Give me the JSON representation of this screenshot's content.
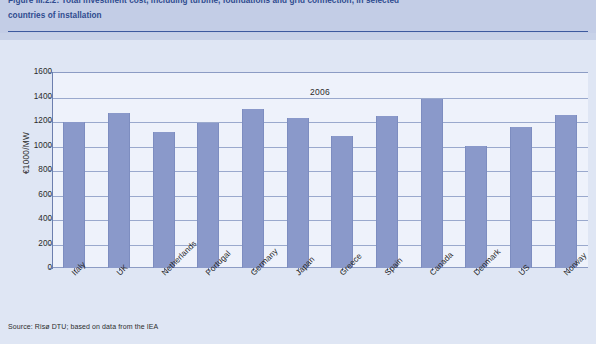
{
  "figure": {
    "caption_line1": "Figure III.2.2: Total investment cost, including turbine, foundations and grid connection, in selected",
    "caption_line2": "countries of installation",
    "source_note": "Source: Risø DTU; based on data from the IEA"
  },
  "colors": {
    "bar_fill": "#8a99ca",
    "header_band": "#c3cde6",
    "figure_background": "#dfe6f4",
    "plot_background": "#eef2fb",
    "caption_text": "#2f4b8f",
    "gridline": "#9aa9cd",
    "axis_line": "#6d7fae"
  },
  "chart_data": {
    "type": "bar",
    "title": "2006",
    "xlabel": "",
    "ylabel": "€1000/MW",
    "ylim": [
      0,
      1600
    ],
    "ytick_step": 200,
    "yticks": [
      "1600",
      "1400",
      "1200",
      "1000",
      "800",
      "600",
      "400",
      "200",
      "0"
    ],
    "grid": true,
    "legend": [
      "2006"
    ],
    "legend_position": "top-center",
    "categories": [
      "Italy",
      "UK",
      "Netherlands",
      "Portugal",
      "Germany",
      "Japan",
      "Greece",
      "Spain",
      "Canada",
      "Denmark",
      "US",
      "Norway"
    ],
    "values": [
      1190,
      1265,
      1110,
      1180,
      1300,
      1225,
      1075,
      1240,
      1380,
      1000,
      1150,
      1250
    ]
  }
}
